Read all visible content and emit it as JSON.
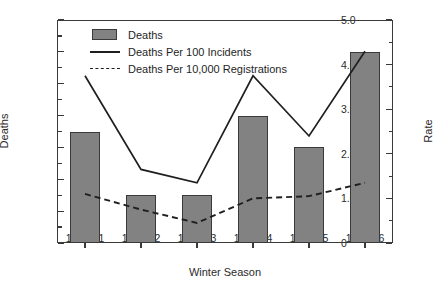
{
  "chart_data": {
    "type": "bar",
    "title": "",
    "xlabel": "Winter Season",
    "ylabel": "Deaths",
    "y2label": "Rate",
    "categories": [
      "1990-91",
      "1991-92",
      "1992-93",
      "1993-94",
      "1994-95",
      "1995-96"
    ],
    "ylim": [
      0,
      14
    ],
    "y2lim": [
      0,
      5.0
    ],
    "yticks": [
      0,
      2,
      4,
      6,
      8,
      10,
      12,
      14
    ],
    "ytick_labels": [
      "0",
      "2",
      "4",
      "6",
      "8",
      "10",
      "12",
      "14"
    ],
    "y2ticks": [
      0,
      1.0,
      2.0,
      3.0,
      4.0,
      5.0
    ],
    "y2tick_labels": [
      "0",
      "1.0",
      "2.0",
      "3.0",
      "4.0",
      "5.0"
    ],
    "grid": false,
    "legend_position": "upper-left-inside",
    "series": [
      {
        "name": "Deaths",
        "kind": "bar",
        "axis": "left",
        "color": "#828282",
        "edge_color": "#3a3a3a",
        "values": [
          7,
          3,
          3,
          8,
          6,
          12
        ]
      },
      {
        "name": "Deaths Per 100 Incidents",
        "kind": "line",
        "style": "solid",
        "axis": "right",
        "color": "#1f1f1f",
        "values": [
          3.75,
          1.65,
          1.35,
          3.75,
          2.4,
          4.3
        ]
      },
      {
        "name": "Deaths Per 10,000 Registrations",
        "kind": "line",
        "style": "dashed",
        "axis": "right",
        "color": "#1f1f1f",
        "values": [
          1.1,
          0.75,
          0.45,
          1.0,
          1.05,
          1.35
        ]
      }
    ]
  },
  "legend": {
    "items": [
      {
        "label": "Deaths",
        "key": "filled-square"
      },
      {
        "label": "Deaths Per 100 Incidents",
        "key": "solid-line"
      },
      {
        "label": "Deaths Per 10,000 Registrations",
        "key": "dashed-line"
      }
    ]
  },
  "axes": {
    "left_title": "Deaths",
    "right_title": "Rate",
    "bottom_title": "Winter Season"
  }
}
